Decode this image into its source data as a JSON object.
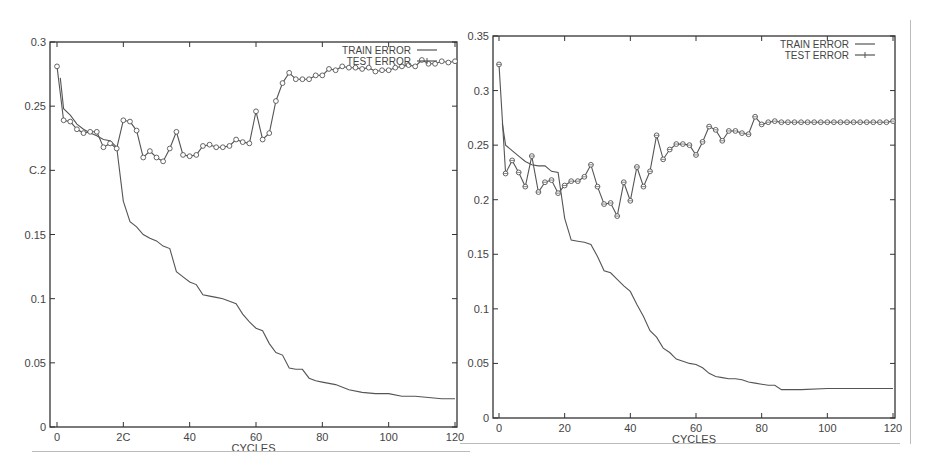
{
  "chart_data": [
    {
      "type": "line",
      "id": "left",
      "title": "",
      "xlabel": "CYCLES",
      "ylabel": "",
      "xlim": [
        0,
        120
      ],
      "ylim": [
        0,
        0.3
      ],
      "grid": false,
      "legend_position": "top-right",
      "x_ticks": [
        "0",
        "2C",
        "40",
        "60",
        "80",
        "100",
        "120"
      ],
      "y_ticks": [
        "0",
        "0.05",
        "0.1",
        "0.15",
        "C.2",
        "0.25",
        "0.3"
      ],
      "series": [
        {
          "name": "TRAIN ERROR",
          "marker": "none",
          "x": [
            1,
            2,
            4,
            6,
            8,
            10,
            12,
            14,
            16,
            18,
            20,
            22,
            24,
            26,
            28,
            30,
            32,
            34,
            36,
            38,
            40,
            42,
            44,
            46,
            48,
            50,
            52,
            54,
            56,
            58,
            60,
            62,
            64,
            66,
            68,
            70,
            72,
            74,
            76,
            78,
            80,
            84,
            88,
            92,
            96,
            100,
            104,
            108,
            112,
            116,
            120
          ],
          "values": [
            0.272,
            0.248,
            0.243,
            0.236,
            0.232,
            0.229,
            0.227,
            0.224,
            0.223,
            0.218,
            0.176,
            0.16,
            0.156,
            0.15,
            0.147,
            0.145,
            0.141,
            0.139,
            0.121,
            0.117,
            0.113,
            0.111,
            0.103,
            0.102,
            0.101,
            0.1,
            0.098,
            0.096,
            0.088,
            0.082,
            0.077,
            0.075,
            0.065,
            0.058,
            0.056,
            0.046,
            0.045,
            0.045,
            0.038,
            0.036,
            0.035,
            0.033,
            0.029,
            0.027,
            0.026,
            0.026,
            0.024,
            0.024,
            0.023,
            0.022,
            0.022
          ]
        },
        {
          "name": "TEST ERROR",
          "marker": "circle",
          "x": [
            0,
            2,
            4,
            6,
            8,
            10,
            12,
            14,
            16,
            18,
            20,
            22,
            24,
            26,
            28,
            30,
            32,
            34,
            36,
            38,
            40,
            42,
            44,
            46,
            48,
            50,
            52,
            54,
            56,
            58,
            60,
            62,
            64,
            66,
            68,
            70,
            72,
            74,
            76,
            78,
            80,
            82,
            84,
            86,
            88,
            90,
            92,
            94,
            96,
            98,
            100,
            102,
            104,
            106,
            108,
            110,
            112,
            114,
            116,
            118,
            120
          ],
          "values": [
            0.281,
            0.239,
            0.238,
            0.232,
            0.229,
            0.23,
            0.23,
            0.218,
            0.221,
            0.217,
            0.239,
            0.238,
            0.231,
            0.21,
            0.215,
            0.21,
            0.207,
            0.217,
            0.23,
            0.212,
            0.211,
            0.212,
            0.219,
            0.22,
            0.218,
            0.218,
            0.219,
            0.224,
            0.222,
            0.221,
            0.246,
            0.224,
            0.229,
            0.254,
            0.268,
            0.276,
            0.271,
            0.271,
            0.271,
            0.274,
            0.274,
            0.279,
            0.278,
            0.281,
            0.28,
            0.28,
            0.279,
            0.28,
            0.277,
            0.278,
            0.278,
            0.28,
            0.281,
            0.282,
            0.281,
            0.286,
            0.283,
            0.283,
            0.285,
            0.284,
            0.285
          ]
        }
      ]
    },
    {
      "type": "line",
      "id": "right",
      "title": "",
      "xlabel": "CYCLES",
      "ylabel": "",
      "xlim": [
        0,
        120
      ],
      "ylim": [
        0,
        0.35
      ],
      "grid": false,
      "legend_position": "top-right",
      "x_ticks": [
        "0",
        "20",
        "40",
        "60",
        "80",
        "100",
        "120"
      ],
      "y_ticks": [
        "0",
        "0.05",
        "0.1",
        "0.15",
        "0.2",
        "0.25",
        "0.3",
        "0.35"
      ],
      "series": [
        {
          "name": "TRAIN ERROR",
          "marker": "none",
          "x": [
            1,
            2,
            4,
            6,
            8,
            10,
            12,
            14,
            16,
            18,
            20,
            22,
            24,
            26,
            28,
            30,
            32,
            34,
            36,
            38,
            40,
            42,
            44,
            46,
            48,
            50,
            52,
            54,
            56,
            58,
            60,
            62,
            64,
            66,
            68,
            70,
            72,
            74,
            76,
            78,
            80,
            82,
            84,
            86,
            88,
            92,
            100,
            110,
            120
          ],
          "values": [
            0.27,
            0.25,
            0.245,
            0.24,
            0.235,
            0.232,
            0.231,
            0.231,
            0.226,
            0.225,
            0.183,
            0.163,
            0.162,
            0.161,
            0.159,
            0.148,
            0.135,
            0.133,
            0.127,
            0.121,
            0.116,
            0.104,
            0.093,
            0.08,
            0.074,
            0.064,
            0.06,
            0.054,
            0.052,
            0.05,
            0.049,
            0.046,
            0.041,
            0.038,
            0.037,
            0.036,
            0.036,
            0.035,
            0.033,
            0.032,
            0.031,
            0.03,
            0.03,
            0.026,
            0.026,
            0.026,
            0.027,
            0.027,
            0.027
          ]
        },
        {
          "name": "TEST ERROR",
          "marker": "circle-plus",
          "x": [
            0,
            2,
            4,
            6,
            8,
            10,
            12,
            14,
            16,
            18,
            20,
            22,
            24,
            26,
            28,
            30,
            32,
            34,
            36,
            38,
            40,
            42,
            44,
            46,
            48,
            50,
            52,
            54,
            56,
            58,
            60,
            62,
            64,
            66,
            68,
            70,
            72,
            74,
            76,
            78,
            80,
            82,
            84,
            86,
            88,
            90,
            92,
            94,
            96,
            98,
            100,
            102,
            104,
            106,
            108,
            110,
            112,
            114,
            116,
            118,
            120
          ],
          "values": [
            0.324,
            0.224,
            0.236,
            0.225,
            0.212,
            0.24,
            0.207,
            0.216,
            0.218,
            0.206,
            0.213,
            0.217,
            0.217,
            0.221,
            0.232,
            0.212,
            0.196,
            0.197,
            0.185,
            0.216,
            0.199,
            0.23,
            0.212,
            0.226,
            0.259,
            0.237,
            0.246,
            0.251,
            0.251,
            0.25,
            0.241,
            0.253,
            0.267,
            0.264,
            0.254,
            0.263,
            0.263,
            0.261,
            0.26,
            0.276,
            0.269,
            0.271,
            0.272,
            0.271,
            0.271,
            0.271,
            0.271,
            0.271,
            0.271,
            0.271,
            0.271,
            0.271,
            0.271,
            0.271,
            0.271,
            0.271,
            0.271,
            0.271,
            0.271,
            0.271,
            0.272
          ]
        }
      ]
    }
  ],
  "charts": {
    "left": {
      "xlabel": "CYCLES",
      "legend": {
        "train": "TRAIN ERROR",
        "test": "TEST ERROR"
      },
      "x_tick_labels": [
        "0",
        "2C",
        "40",
        "60",
        "80",
        "100",
        "120"
      ],
      "y_tick_labels": [
        "0",
        "0.05",
        "0.1",
        "0.15",
        "C.2",
        "0.25",
        "0.3"
      ]
    },
    "right": {
      "xlabel": "CYCLES",
      "legend": {
        "train": "TRAIN ERROR",
        "test": "TEST ERROR"
      },
      "x_tick_labels": [
        "0",
        "20",
        "40",
        "60",
        "80",
        "100",
        "120"
      ],
      "y_tick_labels": [
        "0",
        "0.05",
        "0.1",
        "0.15",
        "0.2",
        "0.25",
        "0.3",
        "0.35"
      ]
    }
  },
  "colors": {
    "line": "#555555",
    "axis": "#333333",
    "text": "#444444",
    "background": "#ffffff"
  }
}
